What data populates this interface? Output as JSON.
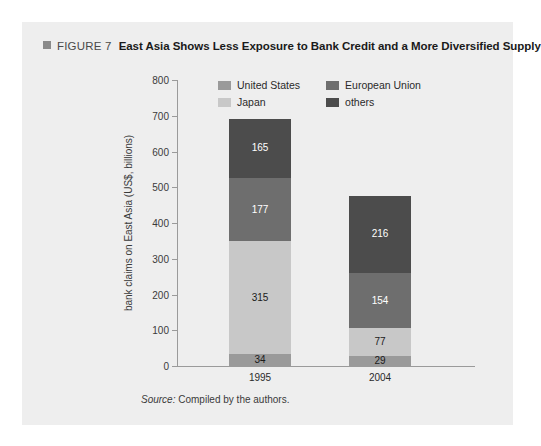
{
  "figure": {
    "marker_icon": "square-marker-icon",
    "number_label": "FIGURE 7",
    "title": "East Asia Shows Less Exposure to Bank Credit and a More Diversified Supply"
  },
  "source": {
    "prefix": "Source:",
    "text": "Compiled by the authors."
  },
  "colors": {
    "panel_background": "#eeeeee",
    "united_states": "#9a9a9a",
    "japan": "#c8c8c8",
    "european_union": "#6e6e6e",
    "others": "#4c4c4c",
    "axis": "#9a9a9a",
    "marker": "#8a8a8a"
  },
  "legend": {
    "items": [
      {
        "label": "United States",
        "color_key": "united_states"
      },
      {
        "label": "European Union",
        "color_key": "european_union"
      },
      {
        "label": "Japan",
        "color_key": "japan"
      },
      {
        "label": "others",
        "color_key": "others"
      }
    ]
  },
  "chart_data": {
    "type": "bar",
    "subtype": "stacked",
    "title": "East Asia Shows Less Exposure to Bank Credit and a More Diversified Supply",
    "xlabel": "",
    "ylabel": "bank claims on East Asia (US$, billions)",
    "ylim": [
      0,
      800
    ],
    "yticks": [
      0,
      100,
      200,
      300,
      400,
      500,
      600,
      700,
      800
    ],
    "ytick_labels": [
      "0",
      "100",
      "200",
      "300",
      "400",
      "500",
      "600",
      "700",
      "800"
    ],
    "grid": false,
    "legend_position": "top-center-inside",
    "categories": [
      "1995",
      "2004"
    ],
    "series": [
      {
        "name": "United States",
        "values": [
          34,
          29
        ],
        "color": "#9a9a9a",
        "label_color": "#1a1a1a"
      },
      {
        "name": "Japan",
        "values": [
          315,
          77
        ],
        "color": "#c8c8c8",
        "label_color": "#1a1a1a"
      },
      {
        "name": "European Union",
        "values": [
          177,
          154
        ],
        "color": "#6e6e6e",
        "label_color": "#ffffff"
      },
      {
        "name": "others",
        "values": [
          165,
          216
        ],
        "color": "#4c4c4c",
        "label_color": "#ffffff"
      }
    ],
    "totals": [
      691,
      476
    ],
    "annotations": {
      "1995": {
        "United States": "34",
        "Japan": "315",
        "European Union": "177",
        "others": "165"
      },
      "2004": {
        "United States": "29",
        "Japan": "77",
        "European Union": "154",
        "others": "216"
      }
    }
  }
}
